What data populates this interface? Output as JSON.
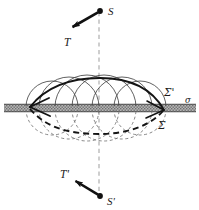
{
  "figure": {
    "type": "physics-diagram",
    "background_color": "#ffffff",
    "ink_color": "#1a1a1a",
    "band_color": "#9a9a9a",
    "band_edge_color": "#5a5a5a",
    "wavelet_color": "#4d4d4d",
    "dash_color": "#a0a0a0",
    "labels": {
      "source_upper": "S",
      "tension_upper": "T",
      "source_lower": "S'",
      "tension_lower": "T'",
      "envelope_upper": "Σ'",
      "envelope_lower": "Σ",
      "plane": "σ"
    },
    "label_positions": {
      "source_upper": {
        "x": 108,
        "y": 13
      },
      "tension_upper": {
        "x": 66,
        "y": 43
      },
      "source_lower": {
        "x": 108,
        "y": 202
      },
      "tension_lower": {
        "x": 62,
        "y": 176
      },
      "envelope_upper": {
        "x": 166,
        "y": 93
      },
      "envelope_lower": {
        "x": 160,
        "y": 126
      },
      "plane": {
        "x": 188,
        "y": 104
      }
    },
    "geometry": {
      "axis_x": 99,
      "plane_y": 108,
      "band_top": 104,
      "band_bottom": 112,
      "band_left": 4,
      "band_right": 196,
      "lens_left_x": 30,
      "lens_right_x": 164,
      "envelope_upper_apex_y": 78,
      "envelope_lower_apex_y": 134,
      "source_upper": {
        "x": 100,
        "y": 11
      },
      "source_lower": {
        "x": 100,
        "y": 196
      },
      "arrow_upper_tip": {
        "x": 69,
        "y": 29
      },
      "arrow_lower_tip": {
        "x": 72,
        "y": 167
      },
      "center_line_top": 12,
      "center_line_bottom": 196,
      "wavelet_centers_x": [
        52,
        69,
        87,
        104,
        122,
        140
      ],
      "wavelet_radii": [
        26,
        30,
        32,
        32,
        30,
        26
      ]
    }
  }
}
